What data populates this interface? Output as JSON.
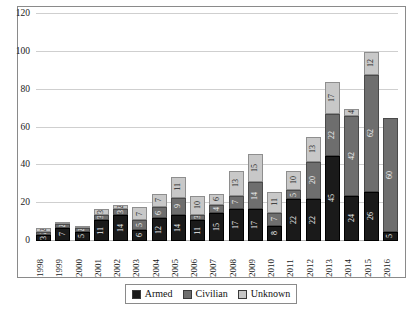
{
  "chart_data": {
    "type": "bar",
    "stacked": true,
    "title": "",
    "xlabel": "",
    "ylabel": "",
    "ylim": [
      0,
      120
    ],
    "yticks": [
      0,
      20,
      40,
      60,
      80,
      100,
      120
    ],
    "grid": true,
    "legend_position": "bottom",
    "categories": [
      "1998",
      "1999",
      "2000",
      "2001",
      "2002",
      "2003",
      "2004",
      "2005",
      "2006",
      "2007",
      "2008",
      "2009",
      "2010",
      "2011",
      "2012",
      "2013",
      "2014",
      "2015",
      "2016"
    ],
    "series": [
      {
        "name": "Armed",
        "color": "#1a1a1a",
        "values": [
          3,
          7,
          5,
          11,
          14,
          6,
          12,
          14,
          11,
          15,
          17,
          17,
          8,
          22,
          22,
          45,
          24,
          26,
          5
        ]
      },
      {
        "name": "Civilian",
        "color": "#6e6e6e",
        "values": [
          2,
          2,
          2,
          3,
          3,
          5,
          6,
          9,
          3,
          4,
          7,
          14,
          7,
          5,
          20,
          22,
          42,
          62,
          60
        ]
      },
      {
        "name": "Unknown",
        "color": "#c8c8c8",
        "values": [
          2,
          1,
          1,
          3,
          2,
          7,
          7,
          11,
          10,
          6,
          13,
          15,
          11,
          10,
          13,
          17,
          4,
          12,
          0
        ]
      }
    ],
    "totals": [
      7,
      10,
      8,
      17,
      19,
      18,
      25,
      34,
      24,
      25,
      37,
      46,
      26,
      37,
      55,
      84,
      70,
      100,
      65
    ]
  },
  "legend": {
    "items": [
      {
        "label": "Armed",
        "key": "armed"
      },
      {
        "label": "Civilian",
        "key": "civilian"
      },
      {
        "label": "Unknown",
        "key": "unknown"
      }
    ]
  }
}
